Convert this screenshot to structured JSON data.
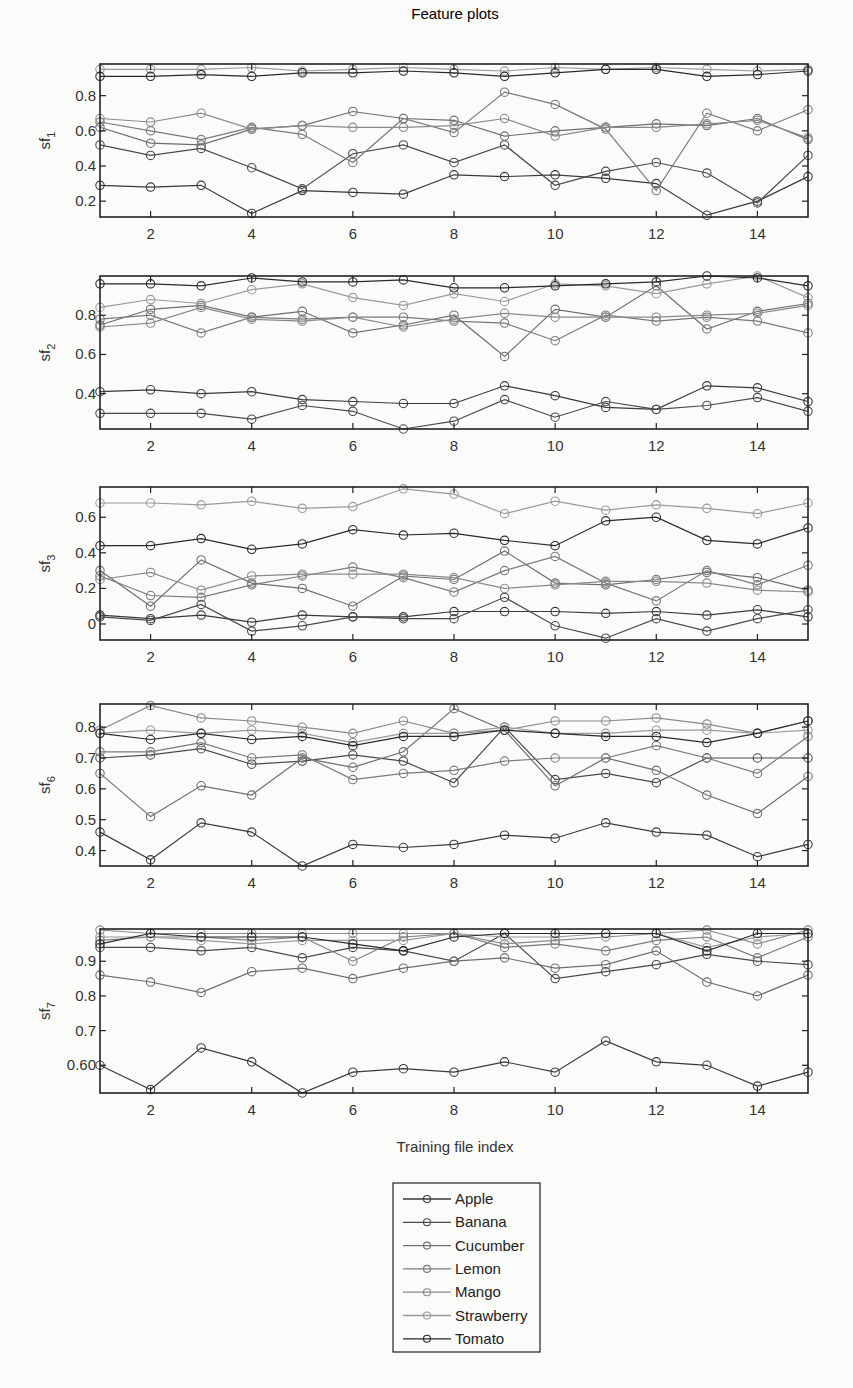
{
  "figure": {
    "title": "Feature plots",
    "xlabel": "Training file index"
  },
  "legend": {
    "entries": [
      "Apple",
      "Banana",
      "Cucumber",
      "Lemon",
      "Mango",
      "Strawberry",
      "Tomato"
    ]
  },
  "colors": {
    "Apple": "#3a3a3a",
    "Banana": "#4a4a4a",
    "Cucumber": "#6e6e6e",
    "Lemon": "#7a7a7a",
    "Mango": "#8a8a8a",
    "Strawberry": "#9a9a9a",
    "Tomato": "#2a2a2a"
  },
  "chart_data": [
    {
      "type": "line",
      "title": "Feature plots",
      "xlabel": "",
      "ylabel": "sf_1",
      "ylabel_main": "sf",
      "ylabel_sub": "1",
      "x": [
        1,
        2,
        3,
        4,
        5,
        6,
        7,
        8,
        9,
        10,
        11,
        12,
        13,
        14,
        15
      ],
      "xticks": [
        2,
        4,
        6,
        8,
        10,
        12,
        14
      ],
      "xtick_labels": [
        "2",
        "4",
        "6",
        "8",
        "10",
        "12",
        "14"
      ],
      "ylim": [
        0.11,
        0.98
      ],
      "yticks": [
        0.2,
        0.4,
        0.6,
        0.8
      ],
      "ytick_labels": [
        "0.2",
        "0.4",
        "0.6",
        "0.8"
      ],
      "grid": false,
      "series": [
        {
          "name": "Apple",
          "values": [
            0.29,
            0.28,
            0.29,
            0.13,
            0.26,
            0.25,
            0.24,
            0.35,
            0.34,
            0.35,
            0.33,
            0.3,
            0.12,
            0.2,
            0.34
          ]
        },
        {
          "name": "Banana",
          "values": [
            0.52,
            0.46,
            0.5,
            0.39,
            0.27,
            0.47,
            0.52,
            0.42,
            0.52,
            0.29,
            0.37,
            0.42,
            0.36,
            0.19,
            0.46
          ]
        },
        {
          "name": "Cucumber",
          "values": [
            0.62,
            0.53,
            0.52,
            0.61,
            0.63,
            0.71,
            0.67,
            0.66,
            0.57,
            0.6,
            0.62,
            0.64,
            0.63,
            0.67,
            0.55
          ]
        },
        {
          "name": "Lemon",
          "values": [
            0.65,
            0.6,
            0.55,
            0.62,
            0.58,
            0.42,
            0.67,
            0.59,
            0.82,
            0.75,
            0.61,
            0.26,
            0.7,
            0.6,
            0.72
          ]
        },
        {
          "name": "Mango",
          "values": [
            0.67,
            0.65,
            0.7,
            0.61,
            0.63,
            0.62,
            0.62,
            0.63,
            0.67,
            0.57,
            0.62,
            0.62,
            0.64,
            0.66,
            0.56
          ]
        },
        {
          "name": "Strawberry",
          "values": [
            0.95,
            0.95,
            0.95,
            0.96,
            0.94,
            0.95,
            0.96,
            0.95,
            0.94,
            0.96,
            0.95,
            0.96,
            0.95,
            0.94,
            0.95
          ]
        },
        {
          "name": "Tomato",
          "values": [
            0.91,
            0.91,
            0.92,
            0.91,
            0.93,
            0.93,
            0.94,
            0.93,
            0.91,
            0.93,
            0.95,
            0.95,
            0.91,
            0.92,
            0.94
          ]
        }
      ]
    },
    {
      "type": "line",
      "title": "",
      "xlabel": "",
      "ylabel": "sf_2",
      "ylabel_main": "sf",
      "ylabel_sub": "2",
      "x": [
        1,
        2,
        3,
        4,
        5,
        6,
        7,
        8,
        9,
        10,
        11,
        12,
        13,
        14,
        15
      ],
      "xticks": [
        2,
        4,
        6,
        8,
        10,
        12,
        14
      ],
      "xtick_labels": [
        "2",
        "4",
        "6",
        "8",
        "10",
        "12",
        "14"
      ],
      "ylim": [
        0.22,
        1.0
      ],
      "yticks": [
        0.4,
        0.6,
        0.8
      ],
      "ytick_labels": [
        "0.4",
        "0.6",
        "0.8"
      ],
      "grid": false,
      "series": [
        {
          "name": "Apple",
          "values": [
            0.41,
            0.42,
            0.4,
            0.41,
            0.37,
            0.36,
            0.35,
            0.35,
            0.44,
            0.39,
            0.33,
            0.32,
            0.44,
            0.43,
            0.36
          ]
        },
        {
          "name": "Banana",
          "values": [
            0.3,
            0.3,
            0.3,
            0.27,
            0.34,
            0.31,
            0.22,
            0.26,
            0.37,
            0.28,
            0.36,
            0.32,
            0.34,
            0.38,
            0.31
          ]
        },
        {
          "name": "Cucumber",
          "values": [
            0.75,
            0.83,
            0.85,
            0.79,
            0.82,
            0.71,
            0.75,
            0.8,
            0.59,
            0.83,
            0.79,
            0.95,
            0.73,
            0.82,
            0.86
          ]
        },
        {
          "name": "Lemon",
          "values": [
            0.78,
            0.8,
            0.71,
            0.79,
            0.78,
            0.79,
            0.79,
            0.77,
            0.76,
            0.67,
            0.8,
            0.77,
            0.79,
            0.77,
            0.71
          ]
        },
        {
          "name": "Mango",
          "values": [
            0.74,
            0.76,
            0.84,
            0.78,
            0.77,
            0.79,
            0.74,
            0.78,
            0.81,
            0.79,
            0.79,
            0.79,
            0.8,
            0.81,
            0.85
          ]
        },
        {
          "name": "Strawberry",
          "values": [
            0.84,
            0.88,
            0.86,
            0.93,
            0.96,
            0.89,
            0.85,
            0.91,
            0.87,
            0.96,
            0.95,
            0.91,
            0.96,
            1.0,
            0.89
          ]
        },
        {
          "name": "Tomato",
          "values": [
            0.96,
            0.96,
            0.95,
            0.99,
            0.97,
            0.97,
            0.98,
            0.94,
            0.94,
            0.95,
            0.96,
            0.97,
            1.0,
            0.99,
            0.95
          ]
        }
      ]
    },
    {
      "type": "line",
      "title": "",
      "xlabel": "",
      "ylabel": "sf_3",
      "ylabel_main": "sf",
      "ylabel_sub": "3",
      "x": [
        1,
        2,
        3,
        4,
        5,
        6,
        7,
        8,
        9,
        10,
        11,
        12,
        13,
        14,
        15
      ],
      "xticks": [
        2,
        4,
        6,
        8,
        10,
        12,
        14
      ],
      "xtick_labels": [
        "2",
        "4",
        "6",
        "8",
        "10",
        "12",
        "14"
      ],
      "ylim": [
        -0.09,
        0.77
      ],
      "yticks": [
        0,
        0.2,
        0.4,
        0.6
      ],
      "ytick_labels": [
        "0",
        "0.2",
        "0.4",
        "0.6"
      ],
      "grid": false,
      "series": [
        {
          "name": "Apple",
          "values": [
            0.05,
            0.03,
            0.05,
            0.01,
            0.05,
            0.04,
            0.04,
            0.07,
            0.07,
            0.07,
            0.06,
            0.07,
            0.05,
            0.08,
            0.04
          ]
        },
        {
          "name": "Banana",
          "values": [
            0.04,
            0.02,
            0.11,
            -0.04,
            -0.01,
            0.04,
            0.03,
            0.03,
            0.15,
            -0.01,
            -0.08,
            0.03,
            -0.04,
            0.03,
            0.08
          ]
        },
        {
          "name": "Cucumber",
          "values": [
            0.3,
            0.1,
            0.36,
            0.23,
            0.2,
            0.1,
            0.27,
            0.25,
            0.41,
            0.23,
            0.22,
            0.25,
            0.29,
            0.26,
            0.19
          ]
        },
        {
          "name": "Lemon",
          "values": [
            0.27,
            0.16,
            0.15,
            0.22,
            0.27,
            0.32,
            0.26,
            0.18,
            0.3,
            0.38,
            0.23,
            0.13,
            0.3,
            0.22,
            0.33
          ]
        },
        {
          "name": "Mango",
          "values": [
            0.25,
            0.29,
            0.19,
            0.27,
            0.28,
            0.28,
            0.28,
            0.26,
            0.2,
            0.22,
            0.24,
            0.24,
            0.23,
            0.19,
            0.18
          ]
        },
        {
          "name": "Strawberry",
          "values": [
            0.68,
            0.68,
            0.67,
            0.69,
            0.65,
            0.66,
            0.76,
            0.73,
            0.62,
            0.69,
            0.64,
            0.67,
            0.65,
            0.62,
            0.68
          ]
        },
        {
          "name": "Tomato",
          "values": [
            0.44,
            0.44,
            0.48,
            0.42,
            0.45,
            0.53,
            0.5,
            0.51,
            0.47,
            0.44,
            0.58,
            0.6,
            0.47,
            0.45,
            0.54
          ]
        }
      ]
    },
    {
      "type": "line",
      "title": "",
      "xlabel": "",
      "ylabel": "sf_6",
      "ylabel_main": "sf",
      "ylabel_sub": "6",
      "x": [
        1,
        2,
        3,
        4,
        5,
        6,
        7,
        8,
        9,
        10,
        11,
        12,
        13,
        14,
        15
      ],
      "xticks": [
        2,
        4,
        6,
        8,
        10,
        12,
        14
      ],
      "xtick_labels": [
        "2",
        "4",
        "6",
        "8",
        "10",
        "12",
        "14"
      ],
      "ylim": [
        0.35,
        0.875
      ],
      "yticks": [
        0.4,
        0.5,
        0.6,
        0.7,
        0.8
      ],
      "ytick_labels": [
        "0.4",
        "0.5",
        "0.6",
        "0.7",
        "0.8"
      ],
      "grid": false,
      "series": [
        {
          "name": "Apple",
          "values": [
            0.46,
            0.37,
            0.49,
            0.46,
            0.35,
            0.42,
            0.41,
            0.42,
            0.45,
            0.44,
            0.49,
            0.46,
            0.45,
            0.38,
            0.42
          ]
        },
        {
          "name": "Banana",
          "values": [
            0.7,
            0.71,
            0.73,
            0.68,
            0.69,
            0.71,
            0.69,
            0.62,
            0.8,
            0.63,
            0.65,
            0.62,
            0.7,
            0.7,
            0.7
          ]
        },
        {
          "name": "Cucumber",
          "values": [
            0.65,
            0.51,
            0.61,
            0.58,
            0.7,
            0.67,
            0.72,
            0.86,
            0.79,
            0.61,
            0.7,
            0.66,
            0.58,
            0.52,
            0.64
          ]
        },
        {
          "name": "Lemon",
          "values": [
            0.72,
            0.72,
            0.75,
            0.7,
            0.71,
            0.63,
            0.65,
            0.66,
            0.69,
            0.7,
            0.7,
            0.74,
            0.7,
            0.65,
            0.77
          ]
        },
        {
          "name": "Mango",
          "values": [
            0.79,
            0.87,
            0.83,
            0.82,
            0.8,
            0.78,
            0.82,
            0.78,
            0.79,
            0.82,
            0.82,
            0.83,
            0.81,
            0.78,
            0.82
          ]
        },
        {
          "name": "Strawberry",
          "values": [
            0.78,
            0.79,
            0.78,
            0.79,
            0.78,
            0.75,
            0.78,
            0.78,
            0.8,
            0.78,
            0.78,
            0.79,
            0.79,
            0.78,
            0.79
          ]
        },
        {
          "name": "Tomato",
          "values": [
            0.78,
            0.76,
            0.78,
            0.76,
            0.77,
            0.74,
            0.77,
            0.77,
            0.79,
            0.78,
            0.77,
            0.77,
            0.75,
            0.78,
            0.82
          ]
        }
      ]
    },
    {
      "type": "line",
      "title": "",
      "xlabel": "Training file index",
      "ylabel": "sf_7",
      "ylabel_main": "sf",
      "ylabel_sub": "7",
      "x": [
        1,
        2,
        3,
        4,
        5,
        6,
        7,
        8,
        9,
        10,
        11,
        12,
        13,
        14,
        15
      ],
      "xticks": [
        2,
        4,
        6,
        8,
        10,
        12,
        14
      ],
      "xtick_labels": [
        "2",
        "4",
        "6",
        "8",
        "10",
        "12",
        "14"
      ],
      "ylim": [
        0.52,
        0.993
      ],
      "yticks": [
        0.6,
        0.7,
        0.8,
        0.9
      ],
      "ytick_labels": [
        "0.60",
        "0.7",
        "0.8",
        "0.9"
      ],
      "grid": false,
      "series": [
        {
          "name": "Apple",
          "values": [
            0.6,
            0.53,
            0.65,
            0.61,
            0.52,
            0.58,
            0.59,
            0.58,
            0.61,
            0.58,
            0.67,
            0.61,
            0.6,
            0.54,
            0.58
          ]
        },
        {
          "name": "Banana",
          "values": [
            0.94,
            0.94,
            0.93,
            0.94,
            0.91,
            0.94,
            0.93,
            0.9,
            0.98,
            0.85,
            0.87,
            0.89,
            0.92,
            0.9,
            0.89
          ]
        },
        {
          "name": "Cucumber",
          "values": [
            0.86,
            0.84,
            0.81,
            0.87,
            0.88,
            0.85,
            0.88,
            0.9,
            0.91,
            0.88,
            0.89,
            0.93,
            0.84,
            0.8,
            0.86
          ]
        },
        {
          "name": "Lemon",
          "values": [
            0.96,
            0.97,
            0.97,
            0.96,
            0.97,
            0.9,
            0.97,
            0.98,
            0.94,
            0.95,
            0.93,
            0.96,
            0.97,
            0.91,
            0.97
          ]
        },
        {
          "name": "Mango",
          "values": [
            0.99,
            0.98,
            0.98,
            0.98,
            0.98,
            0.98,
            0.98,
            0.98,
            0.95,
            0.96,
            0.97,
            0.98,
            0.99,
            0.95,
            0.99
          ]
        },
        {
          "name": "Strawberry",
          "values": [
            0.97,
            0.97,
            0.96,
            0.95,
            0.96,
            0.96,
            0.96,
            0.98,
            0.97,
            0.97,
            0.98,
            0.98,
            0.94,
            0.97,
            0.98
          ]
        },
        {
          "name": "Tomato",
          "values": [
            0.95,
            0.98,
            0.97,
            0.97,
            0.97,
            0.95,
            0.93,
            0.97,
            0.98,
            0.98,
            0.98,
            0.98,
            0.93,
            0.98,
            0.98
          ]
        }
      ]
    }
  ],
  "layout": {
    "plots": [
      {
        "left": 100,
        "top": 64,
        "right": 808,
        "bottom": 217
      },
      {
        "left": 100,
        "top": 276,
        "right": 808,
        "bottom": 429
      },
      {
        "left": 100,
        "top": 487,
        "right": 808,
        "bottom": 640
      },
      {
        "left": 100,
        "top": 704,
        "right": 808,
        "bottom": 866
      },
      {
        "left": 100,
        "top": 929,
        "right": 808,
        "bottom": 1093
      }
    ],
    "title_pos": {
      "x": 455,
      "y": 19
    },
    "xlabel_pos": {
      "x": 455,
      "y": 1152
    },
    "legend_box": {
      "left": 393,
      "top": 1183,
      "right": 540,
      "bottom": 1352
    }
  }
}
